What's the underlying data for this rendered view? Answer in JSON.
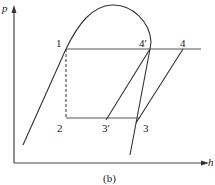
{
  "diagram": {
    "axes": {
      "y_label": "p",
      "x_label": "h"
    },
    "points": {
      "p1": "1",
      "p2": "2",
      "p3": "3",
      "p3prime": "3′",
      "p4": "4",
      "p4prime": "4′"
    },
    "caption": "(b)",
    "colors": {
      "line": "#333333",
      "axis": "#444444",
      "background": "#ffffff"
    }
  }
}
